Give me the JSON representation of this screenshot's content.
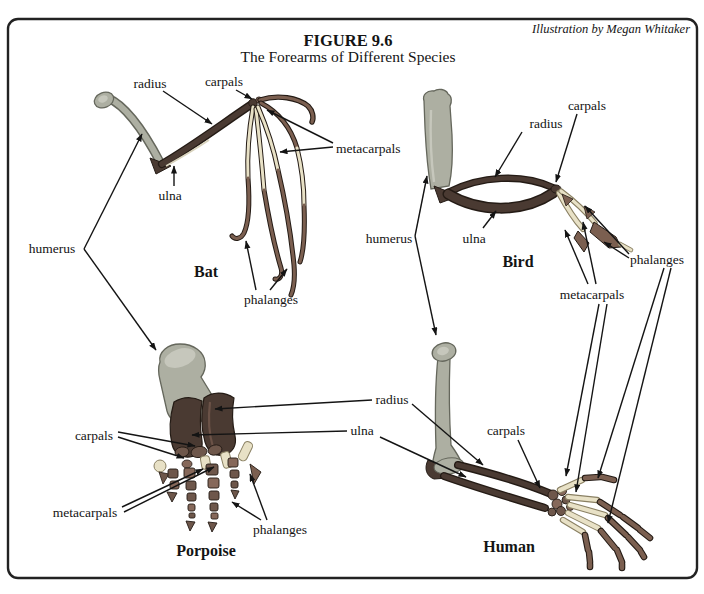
{
  "figure": {
    "title": "FIGURE 9.6",
    "subtitle": "The Forearms of Different Species",
    "credit": "Illustration by Megan Whitaker"
  },
  "terms": {
    "humerus": "humerus",
    "radius": "radius",
    "ulna": "ulna",
    "carpals": "carpals",
    "metacarpals": "metacarpals",
    "phalanges": "phalanges"
  },
  "species": {
    "bat": "Bat",
    "bird": "Bird",
    "porpoise": "Porpoise",
    "human": "Human"
  },
  "colors": {
    "humerus": "#adafa2",
    "humerusline": "#65675c",
    "humerushi": "#c6c7bc",
    "dark": "#4a3a32",
    "darkhi": "#6b5247",
    "darkline": "#241b15",
    "pale": "#e8e1c6",
    "paleline": "#8a8063",
    "phalanx": "#7b5f50",
    "pebble": "#6e574b",
    "pebble2": "#86685a",
    "border": "#222222"
  }
}
